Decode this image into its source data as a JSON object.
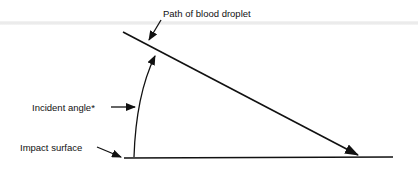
{
  "diagram": {
    "labels": {
      "path": "Path of blood droplet",
      "angle": "Incident angle*",
      "surface": "Impact surface"
    },
    "colors": {
      "ink": "#111111",
      "background": "#ffffff"
    }
  }
}
